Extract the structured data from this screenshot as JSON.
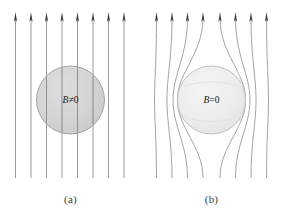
{
  "figure": {
    "background_color": "#ffffff",
    "width": 282,
    "height": 211
  },
  "style": {
    "field_line_color_a": "#8e8e8e",
    "field_line_color_b": "#9a9a9a",
    "arrowhead_color": "#3b3b3b",
    "sphere_a_fill": "#c9c9c9",
    "sphere_a_stroke": "#9b9b9b",
    "sphere_b_fill": "#ededed",
    "sphere_b_stroke": "#c2c2c2",
    "sphere_b_highlight": "#e2e2e2",
    "label_color": "#1a1a1a",
    "caption_color": "#3a3a3a"
  },
  "panels": [
    {
      "id": "a",
      "caption": "(a)",
      "sphere_label_b": "B",
      "sphere_label_rel": "≠",
      "sphere_label_value": "0",
      "sphere_label_full": "B≠0",
      "field_line_count": 8,
      "field_lines_straight": true,
      "arrow_direction": "up",
      "sphere": {
        "cx": 70.5,
        "cy": 100,
        "r": 34
      }
    },
    {
      "id": "b",
      "caption": "(b)",
      "sphere_label_b": "B",
      "sphere_label_rel": "=",
      "sphere_label_value": "0",
      "sphere_label_full": "B=0",
      "field_line_count": 8,
      "field_lines_straight": false,
      "arrow_direction": "up",
      "sphere": {
        "cx": 70.5,
        "cy": 100,
        "r": 34
      }
    }
  ],
  "field_geometry": {
    "top_y": 13,
    "bottom_y": 178,
    "line_x_positions": [
      15.5,
      31.0,
      46.5,
      62.0,
      77.5,
      93.0,
      108.5,
      124.0
    ],
    "deflection_offsets": [
      2,
      5,
      11,
      20,
      -20,
      -11,
      -5,
      -2
    ]
  }
}
